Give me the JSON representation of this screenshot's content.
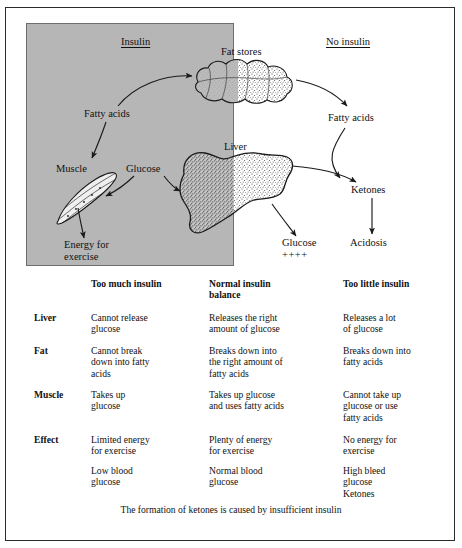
{
  "figure": {
    "panel_labels": {
      "insulin": "Insulin",
      "no_insulin": "No insulin"
    },
    "nodes": {
      "fat_stores": "Fat stores",
      "fatty_acids_left": "Fatty acids",
      "fatty_acids_right": "Fatty acids",
      "muscle": "Muscle",
      "glucose_left": "Glucose",
      "liver": "Liver",
      "energy_line1": "Energy for",
      "energy_line2": "exercise",
      "glucose_right": "Glucose",
      "glucose_plus": "++++",
      "ketones": "Ketones",
      "acidosis": "Acidosis"
    },
    "colors": {
      "panel_fill": "#b6b6b6",
      "stroke": "#1a1a1a",
      "frame": "#2b2b2b"
    }
  },
  "table": {
    "columns": [
      "",
      "Too much insulin",
      "Normal insulin\nbalance",
      "Too little insulin"
    ],
    "rows": [
      {
        "label": "Liver",
        "cells": [
          "Cannot release\nglucose",
          "Releases the right\namount of glucose",
          "Releases a lot\nof glucose"
        ]
      },
      {
        "label": "Fat",
        "cells": [
          "Cannot break\ndown into fatty\nacids",
          "Breaks down into\nthe right amount of\nfatty acids",
          "Breaks down into\nfatty acids"
        ]
      },
      {
        "label": "Muscle",
        "cells": [
          "Takes up\nglucose",
          "Takes up glucose\nand uses fatty acids",
          "Cannot take up\nglucose or use\nfatty acids"
        ]
      },
      {
        "label": "Effect",
        "cells": [
          "Limited energy\nfor exercise",
          "Plenty of energy\nfor exercise",
          "No energy for\nexercise"
        ]
      },
      {
        "label": "",
        "cells": [
          "Low blood\nglucose",
          "Normal blood\nglucose",
          "High bleed\nglucose\nKetones"
        ]
      }
    ],
    "caption": "The formation of ketones is caused by insufficient insulin"
  }
}
